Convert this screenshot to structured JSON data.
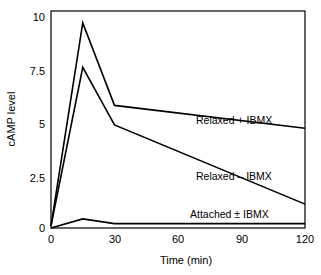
{
  "chart_data": {
    "type": "line",
    "title": "",
    "xlabel": "Time (min)",
    "ylabel": "cAMP level",
    "xlim": [
      0,
      120
    ],
    "ylim": [
      0,
      10
    ],
    "grid": false,
    "legend_position": "inline-right",
    "x_ticks": [
      "0",
      "30",
      "60",
      "90",
      "120"
    ],
    "x_tick_values": [
      0,
      30,
      60,
      90,
      120
    ],
    "y_ticks": [
      "0",
      "2.5",
      "5",
      "7.5",
      "10"
    ],
    "y_tick_values": [
      0,
      2.5,
      5,
      7.5,
      10
    ],
    "series": [
      {
        "name": "Relaxed + IBMX",
        "x": [
          0,
          15,
          30,
          120
        ],
        "values": [
          0.1,
          9.45,
          5.65,
          4.6
        ]
      },
      {
        "name": "Relaxed – IBMX",
        "x": [
          0,
          15,
          30,
          120
        ],
        "values": [
          0.1,
          7.4,
          4.75,
          1.1
        ]
      },
      {
        "name": "Attached ± IBMX",
        "x": [
          0,
          15,
          30,
          120
        ],
        "values": [
          0.0,
          0.42,
          0.2,
          0.2
        ]
      }
    ],
    "annotations": [
      {
        "text": "Relaxed + IBMX",
        "x": 55,
        "y": 5.55
      },
      {
        "text": "Relaxed – IBMX",
        "x": 55,
        "y": 2.95
      },
      {
        "text": "Attached ± IBMX",
        "x": 50,
        "y": 0.72
      }
    ]
  },
  "axes": {
    "y_title": "cAMP level",
    "x_title": "Time (min)",
    "y_tick_labels": [
      "10",
      "7.5",
      "5",
      "2.5",
      "0"
    ],
    "x_tick_labels": [
      "0",
      "30",
      "60",
      "90",
      "120"
    ]
  },
  "series_labels": {
    "relaxed_plus": "Relaxed + IBMX",
    "relaxed_minus": "Relaxed – IBMX",
    "attached": "Attached ± IBMX"
  },
  "colors": {
    "line": "#000000",
    "frame": "#000000",
    "background": "#ffffff",
    "text": "#000000"
  }
}
